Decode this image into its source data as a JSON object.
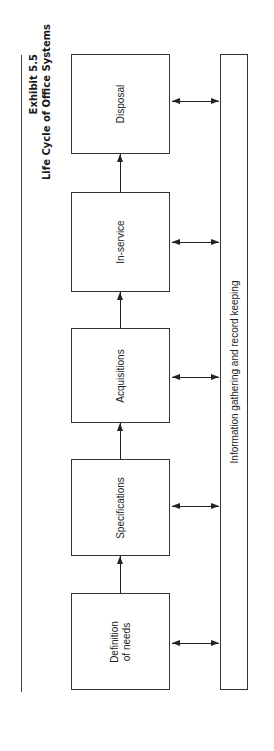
{
  "title": {
    "exhibit": "Exhibit 5.5",
    "caption": "Life Cycle of Office Systems"
  },
  "stages": [
    {
      "label": "Disposal"
    },
    {
      "label": "In-service"
    },
    {
      "label": "Acquisitions"
    },
    {
      "label": "Specifications"
    },
    {
      "label": "Definition\nof needs"
    }
  ],
  "record_bar": {
    "label": "Information gathering and record keeping"
  },
  "flow": {
    "direction": "Definition of needs -> Specifications -> Acquisitions -> In-service -> Disposal",
    "bidirectional_links": "each stage <-> Information gathering and record keeping"
  }
}
